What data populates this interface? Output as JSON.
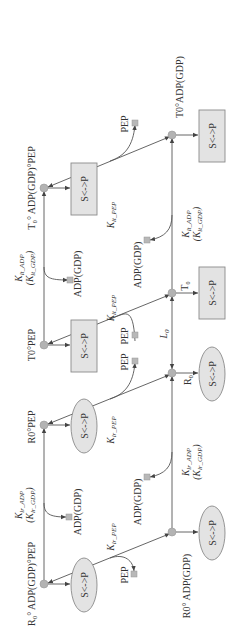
{
  "diagram": {
    "orientation": "rotated 90 degrees counterclockwise",
    "states": {
      "top_left_t0_adp_pep": "T₀° ADP(GDP)°PEP",
      "t0_pep": "T0°PEP",
      "r0_pep": "R0°PEP",
      "r0_adp_pep": "R₀° ADP(GDP)°PEP",
      "t0_adp": "T0°ADP(GDP)",
      "t0": "T₀",
      "r0": "R₀",
      "r0_adp": "R0° ADP(GDP)"
    },
    "transition_label": "S<->P",
    "ligands": {
      "pep": "PEP",
      "adp": "ADP(GDP)"
    },
    "constants": {
      "kt_adp": "K",
      "kt_adp_sub": "lt_ADP",
      "kt_gdp_sub": "lt_GDP",
      "kt_pep_sub": "lt_PEP",
      "kr_adp_sub": "lr_ADP",
      "kr_gdp_sub": "lr_GDP",
      "kr_pep_sub": "lr_PEP",
      "l0": "L",
      "l0_sub": "0"
    }
  }
}
